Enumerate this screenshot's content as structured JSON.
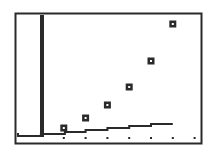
{
  "chart_data": {
    "type": "scatter",
    "title": "",
    "xlabel": "",
    "ylabel": "",
    "grid": false,
    "legend": null,
    "x_ticks": [
      1,
      2,
      3,
      4,
      5,
      6,
      7
    ],
    "xlim": [
      -1,
      7
    ],
    "ylim": [
      0,
      120
    ],
    "series": [
      {
        "name": "data-points",
        "type": "scatter",
        "marker": "square",
        "x": [
          1,
          2,
          3,
          4,
          5,
          6
        ],
        "y": [
          10,
          20,
          33,
          51,
          77,
          114
        ]
      },
      {
        "name": "step-function",
        "type": "step",
        "segments": [
          {
            "x0": -1.1,
            "x1": -0.05,
            "y": 2
          },
          {
            "x0": -0.05,
            "x1": 1.05,
            "y": 4
          },
          {
            "x0": 1.05,
            "x1": 2.0,
            "y": 6
          },
          {
            "x0": 2.0,
            "x1": 3.0,
            "y": 8
          },
          {
            "x0": 3.0,
            "x1": 4.0,
            "y": 10
          },
          {
            "x0": 4.0,
            "x1": 5.0,
            "y": 12
          },
          {
            "x0": 5.0,
            "x1": 6.0,
            "y": 14
          }
        ]
      }
    ]
  },
  "colors": {
    "ink": "#2a2a2a",
    "background": "#ffffff"
  }
}
